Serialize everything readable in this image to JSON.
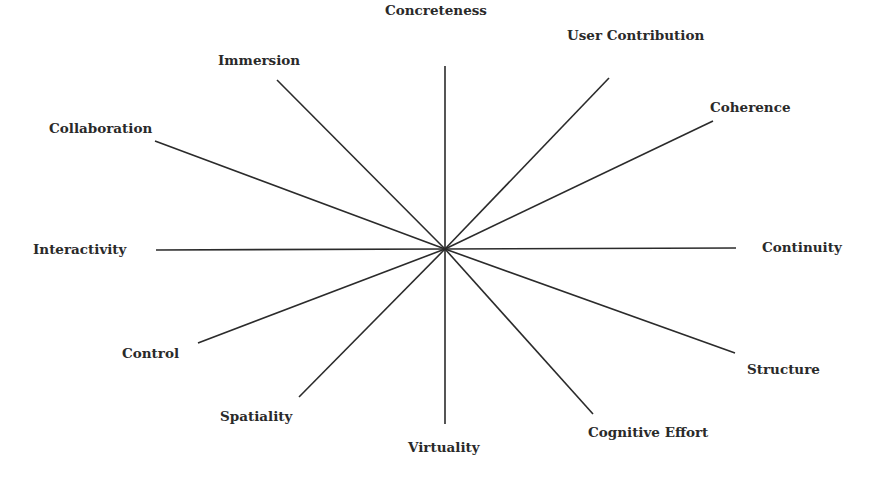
{
  "diagram": {
    "type": "radial-spokes",
    "center": {
      "x": 445,
      "y": 249
    },
    "line_color": "#2b2b2b",
    "text_color": "#2a2a2a",
    "background": "#ffffff",
    "axes": [
      {
        "label": "Concreteness",
        "end": {
          "x": 445,
          "y": 66
        },
        "label_pos": {
          "x": 385,
          "y": 4
        }
      },
      {
        "label": "User Contribution",
        "end": {
          "x": 609,
          "y": 78
        },
        "label_pos": {
          "x": 567,
          "y": 29
        }
      },
      {
        "label": "Coherence",
        "end": {
          "x": 713,
          "y": 121
        },
        "label_pos": {
          "x": 710,
          "y": 101
        }
      },
      {
        "label": "Continuity",
        "end": {
          "x": 736,
          "y": 248
        },
        "label_pos": {
          "x": 762,
          "y": 241
        }
      },
      {
        "label": "Structure",
        "end": {
          "x": 735,
          "y": 353
        },
        "label_pos": {
          "x": 747,
          "y": 363
        }
      },
      {
        "label": "Cognitive Effort",
        "end": {
          "x": 593,
          "y": 414
        },
        "label_pos": {
          "x": 588,
          "y": 426
        }
      },
      {
        "label": "Virtuality",
        "end": {
          "x": 445,
          "y": 424
        },
        "label_pos": {
          "x": 408,
          "y": 441
        }
      },
      {
        "label": "Spatiality",
        "end": {
          "x": 299,
          "y": 397
        },
        "label_pos": {
          "x": 220,
          "y": 410
        }
      },
      {
        "label": "Control",
        "end": {
          "x": 198,
          "y": 343
        },
        "label_pos": {
          "x": 122,
          "y": 347
        }
      },
      {
        "label": "Interactivity",
        "end": {
          "x": 156,
          "y": 250
        },
        "label_pos": {
          "x": 33,
          "y": 243
        }
      },
      {
        "label": "Collaboration",
        "end": {
          "x": 155,
          "y": 141
        },
        "label_pos": {
          "x": 49,
          "y": 122
        }
      },
      {
        "label": "Immersion",
        "end": {
          "x": 277,
          "y": 80
        },
        "label_pos": {
          "x": 218,
          "y": 54
        }
      }
    ]
  }
}
